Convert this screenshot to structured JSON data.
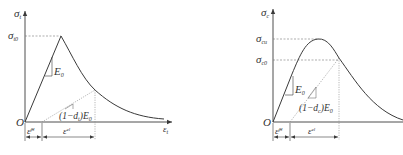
{
  "diagram": {
    "type": "stress-strain curves",
    "colors": {
      "line": "#3a3a3a",
      "dashed": "#777777",
      "text": "#333333"
    },
    "tension": {
      "y_axis": {
        "symbol": "σ",
        "sub": "t"
      },
      "x_axis": {
        "symbol": "ε",
        "sub": "t"
      },
      "origin": "O",
      "peak_label": {
        "symbol": "σ",
        "sub": "t0"
      },
      "slope_label": {
        "symbol": "E",
        "sub": "0"
      },
      "unload_slope_label": {
        "prefix": "(1−d",
        "sub": "t",
        "suffix": ")E",
        "sub2": "0"
      },
      "plastic_strain": {
        "symbol": "ε̃",
        "sub": "t",
        "sup": "pl"
      },
      "elastic_strain": {
        "symbol": "ε",
        "sub": "t",
        "sup": "el"
      }
    },
    "compression": {
      "y_axis": {
        "symbol": "σ",
        "sub": "c"
      },
      "origin": "O",
      "peak_label": {
        "symbol": "σ",
        "sub": "cu"
      },
      "yield_label": {
        "symbol": "σ",
        "sub": "c0"
      },
      "slope_label": {
        "symbol": "E",
        "sub": "0"
      },
      "unload_slope_label": {
        "prefix": "(1−d",
        "sub": "c",
        "suffix": ")E",
        "sub2": "0"
      },
      "plastic_strain": {
        "symbol": "ε̃",
        "sub": "c",
        "sup": "pl"
      },
      "elastic_strain": {
        "symbol": "ε",
        "sub": "c",
        "sup": "el"
      }
    }
  }
}
